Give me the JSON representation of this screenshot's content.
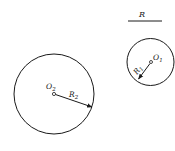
{
  "diagram": {
    "type": "geometry",
    "reference_length": {
      "label": "R",
      "x1": 128,
      "x2": 162,
      "y": 21
    },
    "circles": [
      {
        "id": "large",
        "center_label": "O",
        "center_sub": "2",
        "radius_label": "R",
        "radius_sub": "2",
        "cx": 54,
        "cy": 94,
        "r": 40,
        "radius_end": [
          93,
          107
        ]
      },
      {
        "id": "small",
        "center_label": "O",
        "center_sub": "1",
        "radius_label": "R",
        "radius_sub": "1",
        "cx": 151,
        "cy": 62,
        "r": 23,
        "radius_end": [
          138,
          80
        ]
      }
    ],
    "stroke_color": "#1a1a1a",
    "background": "#ffffff"
  }
}
